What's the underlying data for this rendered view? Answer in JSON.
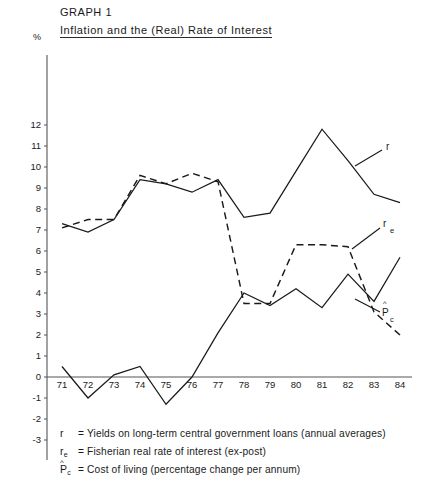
{
  "header": {
    "graph_number": "GRAPH 1",
    "title": "Inflation and the (Real) Rate of Interest",
    "unit_symbol": "%"
  },
  "legend": [
    {
      "symbol_base": "r",
      "symbol_sub": "",
      "symbol_hat": "",
      "text": "= Yields on long-term central government loans (annual averages)"
    },
    {
      "symbol_base": "r",
      "symbol_sub": "e",
      "symbol_hat": "",
      "text": "= Fisherian real rate of interest (ex-post)"
    },
    {
      "symbol_base": "P",
      "symbol_sub": "c",
      "symbol_hat": "^",
      "text": "= Cost of living (percentage change per annum)"
    }
  ],
  "curve_labels": {
    "r": "r",
    "re_base": "r",
    "re_sub": "e",
    "pc_base": "P",
    "pc_sub": "c",
    "pc_hat": "^"
  },
  "chart_data": {
    "type": "line",
    "title": "Inflation and the (Real) Rate of Interest",
    "subtitle": "GRAPH 1",
    "xlabel": "",
    "ylabel": "%",
    "xlim": [
      71,
      84
    ],
    "ylim": [
      -3,
      12
    ],
    "yticks": [
      -3,
      -2,
      -1,
      0,
      1,
      2,
      3,
      4,
      5,
      6,
      7,
      8,
      9,
      10,
      11,
      12
    ],
    "grid": false,
    "legend_position": "below-axes",
    "categories": [
      "71",
      "72",
      "73",
      "74",
      "75",
      "76",
      "77",
      "78",
      "79",
      "80",
      "81",
      "82",
      "83",
      "84"
    ],
    "x": [
      71,
      72,
      73,
      74,
      75,
      76,
      77,
      78,
      79,
      80,
      81,
      82,
      83,
      84
    ],
    "series": [
      {
        "name": "r",
        "label": "r",
        "style": "solid",
        "description": "Yields on long-term central government loans (annual averages)",
        "values": [
          7.3,
          6.9,
          7.5,
          9.4,
          9.2,
          8.8,
          9.4,
          7.6,
          7.8,
          9.8,
          11.8,
          10.3,
          8.7,
          8.3
        ]
      },
      {
        "name": "p_c",
        "label": "Pc",
        "style": "dashed",
        "description": "Cost of living (percentage change per annum)",
        "values": [
          7.1,
          7.5,
          7.5,
          9.6,
          9.2,
          9.7,
          9.3,
          3.5,
          3.5,
          6.3,
          6.3,
          6.2,
          3.1,
          2.0
        ]
      },
      {
        "name": "r_e",
        "label": "re",
        "style": "solid",
        "description": "Fisherian real rate of interest (ex-post)",
        "values": [
          0.5,
          -1.0,
          0.1,
          0.5,
          -1.3,
          0.0,
          2.1,
          4.0,
          3.4,
          4.2,
          3.3,
          4.9,
          3.6,
          5.7
        ]
      }
    ],
    "annotations": [
      {
        "text": "r",
        "x": 84.4,
        "y": 8.9
      },
      {
        "text": "re",
        "x": 84.4,
        "y": 6.4
      },
      {
        "text": "Pc",
        "x": 84.4,
        "y": 2.6
      }
    ]
  }
}
